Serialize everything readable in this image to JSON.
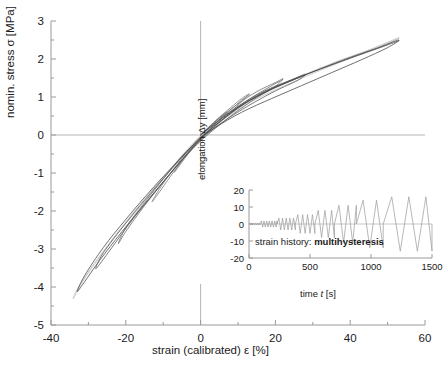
{
  "chart_data": {
    "type": "line",
    "title": "",
    "xlabel": "strain (calibrated) ε [%]",
    "ylabel": "nomin. stress σ [MPa]",
    "xlim": [
      -40,
      60
    ],
    "ylim": [
      -5,
      3
    ],
    "xticks": [
      -40,
      -20,
      0,
      20,
      40,
      60
    ],
    "yticks": [
      -5,
      -4,
      -3,
      -2,
      -1,
      0,
      1,
      2,
      3
    ],
    "grid": "zero-lines-only",
    "legend": "none",
    "series": [
      {
        "name": "loop-1",
        "color": "#8c8c8c",
        "points": [
          [
            0,
            0
          ],
          [
            3,
            0.28
          ],
          [
            6,
            0.52
          ],
          [
            7,
            0.58
          ],
          [
            5,
            0.4
          ],
          [
            2,
            0.1
          ],
          [
            0,
            -0.12
          ],
          [
            -3,
            -0.42
          ],
          [
            -6,
            -0.82
          ],
          [
            -7,
            -0.98
          ],
          [
            -5,
            -0.72
          ],
          [
            -2,
            -0.32
          ],
          [
            0,
            -0.06
          ],
          [
            2,
            0.16
          ],
          [
            4,
            0.36
          ],
          [
            6,
            0.54
          ],
          [
            7,
            0.6
          ]
        ]
      },
      {
        "name": "loop-2",
        "color": "#7d7d7d",
        "points": [
          [
            0,
            0
          ],
          [
            4,
            0.38
          ],
          [
            8,
            0.72
          ],
          [
            11,
            0.96
          ],
          [
            13,
            1.08
          ],
          [
            11,
            0.88
          ],
          [
            8,
            0.6
          ],
          [
            4,
            0.22
          ],
          [
            0,
            -0.14
          ],
          [
            -4,
            -0.56
          ],
          [
            -8,
            -1.08
          ],
          [
            -11,
            -1.5
          ],
          [
            -13,
            -1.76
          ],
          [
            -11,
            -1.42
          ],
          [
            -8,
            -1.0
          ],
          [
            -4,
            -0.5
          ],
          [
            0,
            -0.08
          ],
          [
            4,
            0.3
          ],
          [
            8,
            0.66
          ],
          [
            11,
            0.92
          ],
          [
            13,
            1.06
          ]
        ]
      },
      {
        "name": "loop-3",
        "color": "#6e6e6e",
        "points": [
          [
            0,
            0
          ],
          [
            5,
            0.44
          ],
          [
            10,
            0.82
          ],
          [
            15,
            1.14
          ],
          [
            20,
            1.38
          ],
          [
            22,
            1.48
          ],
          [
            20,
            1.28
          ],
          [
            15,
            0.98
          ],
          [
            10,
            0.64
          ],
          [
            5,
            0.26
          ],
          [
            0,
            -0.16
          ],
          [
            -5,
            -0.66
          ],
          [
            -10,
            -1.24
          ],
          [
            -15,
            -1.86
          ],
          [
            -20,
            -2.54
          ],
          [
            -22,
            -2.86
          ],
          [
            -20,
            -2.44
          ],
          [
            -15,
            -1.78
          ],
          [
            -10,
            -1.16
          ],
          [
            -5,
            -0.56
          ],
          [
            0,
            -0.1
          ],
          [
            6,
            0.42
          ],
          [
            12,
            0.88
          ],
          [
            18,
            1.24
          ],
          [
            22,
            1.46
          ]
        ]
      },
      {
        "name": "loop-4",
        "color": "#5a5a5a",
        "points": [
          [
            0,
            0
          ],
          [
            6,
            0.48
          ],
          [
            12,
            0.88
          ],
          [
            18,
            1.2
          ],
          [
            24,
            1.44
          ],
          [
            28,
            1.6
          ],
          [
            26,
            1.44
          ],
          [
            20,
            1.16
          ],
          [
            14,
            0.84
          ],
          [
            8,
            0.48
          ],
          [
            2,
            0.06
          ],
          [
            0,
            -0.12
          ],
          [
            -6,
            -0.78
          ],
          [
            -12,
            -1.48
          ],
          [
            -18,
            -2.2
          ],
          [
            -24,
            -3.0
          ],
          [
            -28,
            -3.52
          ],
          [
            -26,
            -3.1
          ],
          [
            -20,
            -2.32
          ],
          [
            -14,
            -1.6
          ],
          [
            -8,
            -0.92
          ],
          [
            -2,
            -0.26
          ],
          [
            0,
            -0.06
          ],
          [
            8,
            0.56
          ],
          [
            16,
            1.08
          ],
          [
            24,
            1.42
          ],
          [
            28,
            1.58
          ]
        ]
      },
      {
        "name": "loop-5-outer",
        "color": "#4a4a4a",
        "points": [
          [
            0,
            0
          ],
          [
            8,
            0.6
          ],
          [
            16,
            1.06
          ],
          [
            24,
            1.42
          ],
          [
            32,
            1.74
          ],
          [
            40,
            2.04
          ],
          [
            47,
            2.28
          ],
          [
            53,
            2.5
          ],
          [
            50,
            2.3
          ],
          [
            43,
            1.98
          ],
          [
            35,
            1.64
          ],
          [
            27,
            1.3
          ],
          [
            19,
            0.96
          ],
          [
            11,
            0.6
          ],
          [
            4,
            0.2
          ],
          [
            0,
            -0.1
          ],
          [
            -7,
            -0.88
          ],
          [
            -14,
            -1.7
          ],
          [
            -21,
            -2.54
          ],
          [
            -27,
            -3.3
          ],
          [
            -31,
            -3.86
          ],
          [
            -33,
            -4.12
          ],
          [
            -31,
            -3.7
          ],
          [
            -26,
            -2.96
          ],
          [
            -20,
            -2.22
          ],
          [
            -13,
            -1.42
          ],
          [
            -6,
            -0.68
          ],
          [
            0,
            -0.08
          ],
          [
            10,
            0.72
          ],
          [
            20,
            1.26
          ],
          [
            30,
            1.66
          ],
          [
            40,
            2.02
          ],
          [
            48,
            2.3
          ],
          [
            53,
            2.48
          ]
        ]
      },
      {
        "name": "loop-faint-envelope",
        "color": "#c0c0c0",
        "points": [
          [
            0,
            0
          ],
          [
            9,
            0.68
          ],
          [
            18,
            1.18
          ],
          [
            27,
            1.56
          ],
          [
            36,
            1.92
          ],
          [
            45,
            2.24
          ],
          [
            53,
            2.56
          ],
          [
            49,
            2.36
          ],
          [
            41,
            2.06
          ],
          [
            32,
            1.7
          ],
          [
            23,
            1.32
          ],
          [
            14,
            0.9
          ],
          [
            6,
            0.4
          ],
          [
            0,
            -0.02
          ],
          [
            -8,
            -0.92
          ],
          [
            -16,
            -1.86
          ],
          [
            -23,
            -2.68
          ],
          [
            -29,
            -3.46
          ],
          [
            -33,
            -4.06
          ],
          [
            -34,
            -4.3
          ],
          [
            -31,
            -3.78
          ],
          [
            -24,
            -2.8
          ],
          [
            -17,
            -1.92
          ],
          [
            -9,
            -1.0
          ],
          [
            -2,
            -0.22
          ],
          [
            4,
            0.28
          ],
          [
            14,
            0.94
          ],
          [
            25,
            1.46
          ],
          [
            36,
            1.9
          ],
          [
            46,
            2.26
          ],
          [
            53,
            2.54
          ]
        ]
      }
    ]
  },
  "inset": {
    "chart_data": {
      "type": "line",
      "xlabel": "time t [s]",
      "ylabel": "elongation Δy [mm]",
      "xlim": [
        0,
        1500
      ],
      "ylim": [
        -20,
        20
      ],
      "xticks": [
        0,
        500,
        1000,
        1500
      ],
      "yticks": [
        -20,
        -10,
        0,
        10,
        20
      ],
      "series_name": "strain-history-waveform",
      "color": "#9a9a9a",
      "waveform": "triangular, amplitude increasing in steps",
      "segments": [
        {
          "t_start": 0,
          "t_end": 90,
          "amplitude": 0.6,
          "period": 15
        },
        {
          "t_start": 90,
          "t_end": 230,
          "amplitude": 1.8,
          "period": 22
        },
        {
          "t_start": 230,
          "t_end": 380,
          "amplitude": 3.5,
          "period": 30
        },
        {
          "t_start": 380,
          "t_end": 540,
          "amplitude": 5.5,
          "period": 40
        },
        {
          "t_start": 540,
          "t_end": 700,
          "amplitude": 8.0,
          "period": 55
        },
        {
          "t_start": 700,
          "t_end": 880,
          "amplitude": 11.0,
          "period": 75
        },
        {
          "t_start": 880,
          "t_end": 1100,
          "amplitude": 14.0,
          "period": 110
        },
        {
          "t_start": 1100,
          "t_end": 1500,
          "amplitude": 16.0,
          "period": 140
        }
      ]
    },
    "annotation_prefix": "strain history: ",
    "annotation_value": "multihysteresis"
  },
  "colors": {
    "axis": "#9a9a9a",
    "zero_line": "#b5b5b5",
    "text": "#1a1a1a",
    "curve_dark": "#4a4a4a",
    "curve_light": "#c0c0c0",
    "inset_curve": "#9a9a9a"
  }
}
